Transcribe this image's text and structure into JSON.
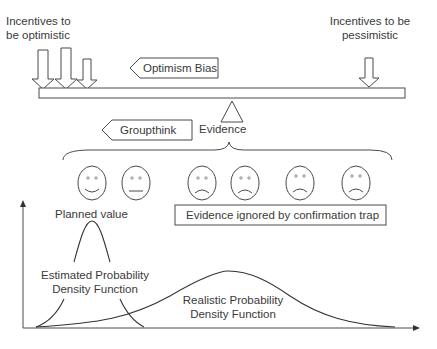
{
  "top": {
    "optimistic_incentives": {
      "line1": "Incentives to",
      "line2": "be optimistic",
      "arrow_count": 3
    },
    "pessimistic_incentives": {
      "line1": "Incentives to be",
      "line2": "pessimistic",
      "arrow_count": 1
    },
    "optimism_bias_label": "Optimism Bias"
  },
  "middle": {
    "groupthink_label": "Groupthink",
    "evidence_label": "Evidence",
    "faces": [
      {
        "mood": "happy"
      },
      {
        "mood": "neutral"
      },
      {
        "mood": "sad"
      },
      {
        "mood": "sad"
      },
      {
        "mood": "sad"
      },
      {
        "mood": "sad"
      }
    ],
    "confirmation_trap_label": "Evidence ignored by confirmation trap"
  },
  "bottom": {
    "planned_value_label": "Planned value",
    "estimated_pdf": {
      "line1": "Estimated Probability",
      "line2": "Density Function"
    },
    "realistic_pdf": {
      "line1": "Realistic Probability",
      "line2": "Density Function"
    }
  },
  "colors": {
    "stroke": "#4a4a4a",
    "text": "#3a3a3a",
    "background": "#ffffff"
  }
}
